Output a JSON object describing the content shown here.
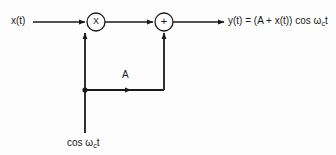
{
  "figure": {
    "name": "am-modulator-block-diagram",
    "background_color": "#fdfdfd",
    "line_color": "#1a1a1a",
    "text_color": "#1a1a1a"
  },
  "labels": {
    "input": "x(t)",
    "output_prefix": "y(t) = (A + x(t)) cos ω",
    "output_sub": "c",
    "output_suffix": "t",
    "carrier_prefix": "cos ω",
    "carrier_sub": "c",
    "carrier_suffix": "t",
    "amplitude": "A"
  },
  "blocks": {
    "multiplier": {
      "symbol": "X",
      "name": "multiplier-block",
      "cx": 96,
      "cy": 22,
      "r": 9
    },
    "summer": {
      "symbol": "+",
      "name": "summer-block",
      "cx": 164,
      "cy": 22,
      "r": 9
    }
  },
  "nodes": {
    "junction": {
      "cx": 85,
      "cy": 90,
      "r": 2.4
    }
  }
}
